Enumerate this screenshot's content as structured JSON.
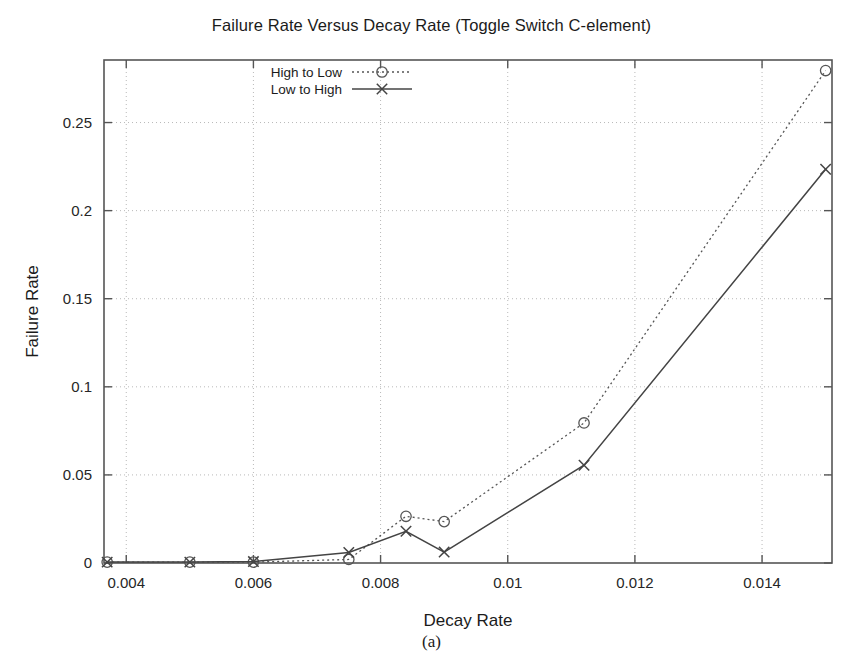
{
  "figure": {
    "caption": "(a)"
  },
  "chart_data": {
    "type": "line",
    "title": "Failure Rate Versus Decay Rate (Toggle Switch C-element)",
    "xlabel": "Decay Rate",
    "ylabel": "Failure Rate",
    "xlim": [
      0.00365,
      0.0151
    ],
    "ylim": [
      0,
      0.2855
    ],
    "xticks": [
      0.004,
      0.006,
      0.008,
      0.01,
      0.012,
      0.014
    ],
    "xtick_labels": [
      "0.004",
      "0.006",
      "0.008",
      "0.01",
      "0.012",
      "0.014"
    ],
    "yticks": [
      0,
      0.05,
      0.1,
      0.15,
      0.2,
      0.25
    ],
    "ytick_labels": [
      "0",
      "0.05",
      "0.1",
      "0.15",
      "0.2",
      "0.25"
    ],
    "grid": true,
    "grid_style": "dotted",
    "legend_position": "top-left-inside",
    "series": [
      {
        "name": "High to Low",
        "marker": "circle",
        "line_style": "dotted",
        "color": "#555555",
        "x": [
          0.0037,
          0.005,
          0.006,
          0.0075,
          0.0084,
          0.009,
          0.0112,
          0.015
        ],
        "y": [
          0.0005,
          0.0005,
          0.0005,
          0.002,
          0.0265,
          0.0235,
          0.0795,
          0.2795
        ]
      },
      {
        "name": "Low to High",
        "marker": "x",
        "line_style": "solid",
        "color": "#444444",
        "x": [
          0.0037,
          0.005,
          0.006,
          0.0075,
          0.0084,
          0.009,
          0.0112,
          0.015
        ],
        "y": [
          0.0005,
          0.0005,
          0.0008,
          0.006,
          0.018,
          0.0062,
          0.0555,
          0.2235
        ]
      }
    ]
  }
}
